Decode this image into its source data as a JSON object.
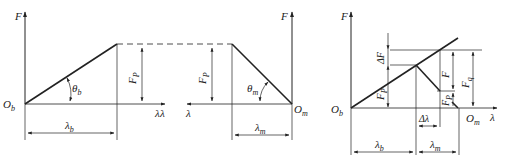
{
  "diagram": {
    "left": {
      "axis_y": "F",
      "axis_x": "λ",
      "origin": "O",
      "origin_sub": "b",
      "angle": "θ",
      "angle_sub": "b",
      "force": "F",
      "force_sub": "P",
      "length": "λ",
      "length_sub": "b"
    },
    "middle": {
      "axis_y": "F",
      "axis_x": "λ",
      "origin": "O",
      "origin_sub": "m",
      "angle": "θ",
      "angle_sub": "m",
      "force": "F",
      "force_sub": "P",
      "length": "λ",
      "length_sub": "m"
    },
    "right": {
      "axis_y": "F",
      "axis_x": "λ",
      "origin_b": "O",
      "origin_b_sub": "b",
      "origin_m": "O",
      "origin_m_sub": "m",
      "delta_f": "ΔF",
      "fp": "F",
      "fp_sub": "P",
      "f": "F",
      "fq": "F",
      "fq_sub": "q",
      "fp2": "F",
      "fp2_sub": "P",
      "fp2_sup": "″",
      "delta_lambda": "Δλ",
      "lb": "λ",
      "lb_sub": "b",
      "lm": "λ",
      "lm_sub": "m"
    }
  }
}
